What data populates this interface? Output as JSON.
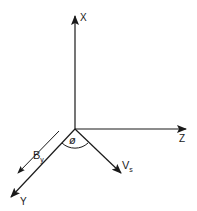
{
  "diagram": {
    "type": "3d-coordinate-axes",
    "colors": {
      "line": "#1a1a1a",
      "background": "#ffffff"
    },
    "axes": {
      "x": {
        "label": "X",
        "direction": "up"
      },
      "z": {
        "label": "Z",
        "direction": "right"
      },
      "y": {
        "label": "Y",
        "direction": "down-left"
      }
    },
    "vectors": {
      "by": {
        "main": "B",
        "sub": "y",
        "direction": "parallel to Y axis"
      },
      "vs": {
        "main": "V",
        "sub": "s",
        "direction": "down-right"
      }
    },
    "angle": {
      "symbol": "ø",
      "between": [
        "Y",
        "Vs"
      ]
    }
  }
}
